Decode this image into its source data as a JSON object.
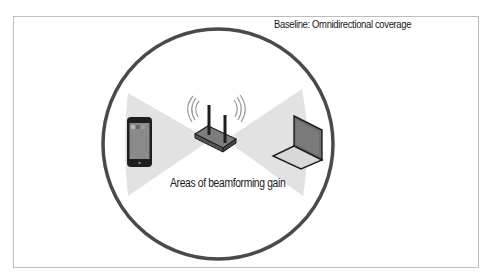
{
  "diagram": {
    "title": "Baseline: Omnidirectional coverage",
    "caption": "Areas of beamforming gain",
    "elements": {
      "coverage_circle": {
        "shape": "circle",
        "meaning": "omnidirectional coverage",
        "color": "#4a4a4a"
      },
      "beams": [
        {
          "side": "left",
          "meaning": "beamforming gain toward phone",
          "color": "#e0e0e0"
        },
        {
          "side": "right",
          "meaning": "beamforming gain toward laptop",
          "color": "#e0e0e0"
        }
      ],
      "devices": [
        {
          "name": "phone",
          "icon": "smartphone-icon"
        },
        {
          "name": "router",
          "icon": "wireless-router-icon"
        },
        {
          "name": "laptop",
          "icon": "laptop-icon"
        }
      ]
    },
    "colors": {
      "circle": "#4a4a4a",
      "beam": "#e2e2e2",
      "device_fill": "#7a7a7a",
      "frame": "#bdbdbd"
    }
  }
}
